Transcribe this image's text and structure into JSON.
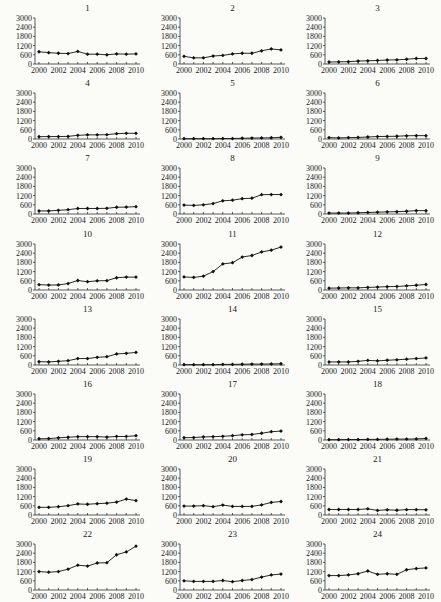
{
  "figure": {
    "layout": {
      "rows": 8,
      "cols": 3
    }
  },
  "chart_data": [
    {
      "type": "line",
      "title": "1",
      "x": [
        2000,
        2001,
        2002,
        2003,
        2004,
        2005,
        2006,
        2007,
        2008,
        2009,
        2010
      ],
      "values": [
        800,
        740,
        700,
        680,
        820,
        640,
        640,
        600,
        660,
        640,
        660
      ],
      "xlabel": "",
      "ylabel": "",
      "ylim": [
        0,
        3000
      ],
      "yticks": [
        0,
        600,
        1200,
        1800,
        2400,
        3000
      ],
      "xticks": [
        2000,
        2002,
        2004,
        2006,
        2008,
        2010
      ],
      "grid": false
    },
    {
      "type": "line",
      "title": "2",
      "x": [
        2000,
        2001,
        2002,
        2003,
        2004,
        2005,
        2006,
        2007,
        2008,
        2009,
        2010
      ],
      "values": [
        500,
        400,
        400,
        520,
        560,
        660,
        700,
        700,
        860,
        980,
        920
      ],
      "xlabel": "",
      "ylabel": "",
      "ylim": [
        0,
        3000
      ],
      "yticks": [
        0,
        600,
        1200,
        1800,
        2400,
        3000
      ],
      "xticks": [
        2000,
        2002,
        2004,
        2006,
        2008,
        2010
      ],
      "grid": false
    },
    {
      "type": "line",
      "title": "3",
      "x": [
        2000,
        2001,
        2002,
        2003,
        2004,
        2005,
        2006,
        2007,
        2008,
        2009,
        2010
      ],
      "values": [
        130,
        140,
        150,
        190,
        210,
        230,
        260,
        270,
        310,
        360,
        360
      ],
      "xlabel": "",
      "ylabel": "",
      "ylim": [
        0,
        3000
      ],
      "yticks": [
        0,
        600,
        1200,
        1800,
        2400,
        3000
      ],
      "xticks": [
        2000,
        2002,
        2004,
        2006,
        2008,
        2010
      ],
      "grid": false
    },
    {
      "type": "line",
      "title": "4",
      "x": [
        2000,
        2001,
        2002,
        2003,
        2004,
        2005,
        2006,
        2007,
        2008,
        2009,
        2010
      ],
      "values": [
        150,
        160,
        160,
        170,
        240,
        270,
        270,
        280,
        350,
        370,
        370
      ],
      "xlabel": "",
      "ylabel": "",
      "ylim": [
        0,
        3000
      ],
      "yticks": [
        0,
        600,
        1200,
        1800,
        2400,
        3000
      ],
      "xticks": [
        2000,
        2002,
        2004,
        2006,
        2008,
        2010
      ],
      "grid": false
    },
    {
      "type": "line",
      "title": "5",
      "x": [
        2000,
        2001,
        2002,
        2003,
        2004,
        2005,
        2006,
        2007,
        2008,
        2009,
        2010
      ],
      "values": [
        20,
        20,
        20,
        20,
        30,
        30,
        50,
        60,
        70,
        80,
        110
      ],
      "xlabel": "",
      "ylabel": "",
      "ylim": [
        0,
        3000
      ],
      "yticks": [
        0,
        600,
        1200,
        1800,
        2400,
        3000
      ],
      "xticks": [
        2000,
        2002,
        2004,
        2006,
        2008,
        2010
      ],
      "grid": false
    },
    {
      "type": "line",
      "title": "6",
      "x": [
        2000,
        2001,
        2002,
        2003,
        2004,
        2005,
        2006,
        2007,
        2008,
        2009,
        2010
      ],
      "values": [
        90,
        70,
        90,
        100,
        130,
        160,
        170,
        180,
        210,
        220,
        220
      ],
      "xlabel": "",
      "ylabel": "",
      "ylim": [
        0,
        3000
      ],
      "yticks": [
        0,
        600,
        1200,
        1800,
        2400,
        3000
      ],
      "xticks": [
        2000,
        2002,
        2004,
        2006,
        2008,
        2010
      ],
      "grid": false
    },
    {
      "type": "line",
      "title": "7",
      "x": [
        2000,
        2001,
        2002,
        2003,
        2004,
        2005,
        2006,
        2007,
        2008,
        2009,
        2010
      ],
      "values": [
        200,
        200,
        240,
        280,
        360,
        360,
        360,
        370,
        440,
        450,
        480
      ],
      "xlabel": "",
      "ylabel": "",
      "ylim": [
        0,
        3000
      ],
      "yticks": [
        0,
        600,
        1200,
        1800,
        2400,
        3000
      ],
      "xticks": [
        2000,
        2002,
        2004,
        2006,
        2008,
        2010
      ],
      "grid": false
    },
    {
      "type": "line",
      "title": "8",
      "x": [
        2000,
        2001,
        2002,
        2003,
        2004,
        2005,
        2006,
        2007,
        2008,
        2009,
        2010
      ],
      "values": [
        580,
        560,
        600,
        680,
        860,
        900,
        1000,
        1030,
        1260,
        1270,
        1270
      ],
      "xlabel": "",
      "ylabel": "",
      "ylim": [
        0,
        3000
      ],
      "yticks": [
        0,
        600,
        1200,
        1800,
        2400,
        3000
      ],
      "xticks": [
        2000,
        2002,
        2004,
        2006,
        2008,
        2010
      ],
      "grid": false
    },
    {
      "type": "line",
      "title": "9",
      "x": [
        2000,
        2001,
        2002,
        2003,
        2004,
        2005,
        2006,
        2007,
        2008,
        2009,
        2010
      ],
      "values": [
        60,
        60,
        60,
        80,
        100,
        120,
        140,
        150,
        180,
        220,
        220
      ],
      "xlabel": "",
      "ylabel": "",
      "ylim": [
        0,
        3000
      ],
      "yticks": [
        0,
        600,
        1200,
        1800,
        2400,
        3000
      ],
      "xticks": [
        2000,
        2002,
        2004,
        2006,
        2008,
        2010
      ],
      "grid": false
    },
    {
      "type": "line",
      "title": "10",
      "x": [
        2000,
        2001,
        2002,
        2003,
        2004,
        2005,
        2006,
        2007,
        2008,
        2009,
        2010
      ],
      "values": [
        350,
        320,
        330,
        420,
        620,
        540,
        600,
        610,
        800,
        840,
        840
      ],
      "xlabel": "",
      "ylabel": "",
      "ylim": [
        0,
        3000
      ],
      "yticks": [
        0,
        600,
        1200,
        1800,
        2400,
        3000
      ],
      "xticks": [
        2000,
        2002,
        2004,
        2006,
        2008,
        2010
      ],
      "grid": false
    },
    {
      "type": "line",
      "title": "11",
      "x": [
        2000,
        2001,
        2002,
        2003,
        2004,
        2005,
        2006,
        2007,
        2008,
        2009,
        2010
      ],
      "values": [
        850,
        820,
        900,
        1200,
        1700,
        1780,
        2150,
        2250,
        2480,
        2600,
        2800
      ],
      "xlabel": "",
      "ylabel": "",
      "ylim": [
        0,
        3000
      ],
      "yticks": [
        0,
        600,
        1200,
        1800,
        2400,
        3000
      ],
      "xticks": [
        2000,
        2002,
        2004,
        2006,
        2008,
        2010
      ],
      "grid": false
    },
    {
      "type": "line",
      "title": "12",
      "x": [
        2000,
        2001,
        2002,
        2003,
        2004,
        2005,
        2006,
        2007,
        2008,
        2009,
        2010
      ],
      "values": [
        120,
        130,
        140,
        140,
        170,
        190,
        220,
        230,
        270,
        310,
        360
      ],
      "xlabel": "",
      "ylabel": "",
      "ylim": [
        0,
        3000
      ],
      "yticks": [
        0,
        600,
        1200,
        1800,
        2400,
        3000
      ],
      "xticks": [
        2000,
        2002,
        2004,
        2006,
        2008,
        2010
      ],
      "grid": false
    },
    {
      "type": "line",
      "title": "13",
      "x": [
        2000,
        2001,
        2002,
        2003,
        2004,
        2005,
        2006,
        2007,
        2008,
        2009,
        2010
      ],
      "values": [
        220,
        200,
        240,
        280,
        420,
        420,
        500,
        540,
        720,
        760,
        820
      ],
      "xlabel": "",
      "ylabel": "",
      "ylim": [
        0,
        3000
      ],
      "yticks": [
        0,
        600,
        1200,
        1800,
        2400,
        3000
      ],
      "xticks": [
        2000,
        2002,
        2004,
        2006,
        2008,
        2010
      ],
      "grid": false
    },
    {
      "type": "line",
      "title": "14",
      "x": [
        2000,
        2001,
        2002,
        2003,
        2004,
        2005,
        2006,
        2007,
        2008,
        2009,
        2010
      ],
      "values": [
        20,
        20,
        20,
        20,
        40,
        40,
        50,
        60,
        60,
        70,
        80
      ],
      "xlabel": "",
      "ylabel": "",
      "ylim": [
        0,
        3000
      ],
      "yticks": [
        0,
        600,
        1200,
        1800,
        2400,
        3000
      ],
      "xticks": [
        2000,
        2002,
        2004,
        2006,
        2008,
        2010
      ],
      "grid": false
    },
    {
      "type": "line",
      "title": "15",
      "x": [
        2000,
        2001,
        2002,
        2003,
        2004,
        2005,
        2006,
        2007,
        2008,
        2009,
        2010
      ],
      "values": [
        200,
        200,
        200,
        240,
        300,
        270,
        310,
        340,
        380,
        420,
        460
      ],
      "xlabel": "",
      "ylabel": "",
      "ylim": [
        0,
        3000
      ],
      "yticks": [
        0,
        600,
        1200,
        1800,
        2400,
        3000
      ],
      "xticks": [
        2000,
        2002,
        2004,
        2006,
        2008,
        2010
      ],
      "grid": false
    },
    {
      "type": "line",
      "title": "16",
      "x": [
        2000,
        2001,
        2002,
        2003,
        2004,
        2005,
        2006,
        2007,
        2008,
        2009,
        2010
      ],
      "values": [
        80,
        90,
        140,
        180,
        220,
        220,
        220,
        190,
        230,
        230,
        280
      ],
      "xlabel": "",
      "ylabel": "",
      "ylim": [
        0,
        3000
      ],
      "yticks": [
        0,
        600,
        1200,
        1800,
        2400,
        3000
      ],
      "xticks": [
        2000,
        2002,
        2004,
        2006,
        2008,
        2010
      ],
      "grid": false
    },
    {
      "type": "line",
      "title": "17",
      "x": [
        2000,
        2001,
        2002,
        2003,
        2004,
        2005,
        2006,
        2007,
        2008,
        2009,
        2010
      ],
      "values": [
        150,
        160,
        200,
        220,
        240,
        280,
        340,
        360,
        440,
        540,
        580
      ],
      "xlabel": "",
      "ylabel": "",
      "ylim": [
        0,
        3000
      ],
      "yticks": [
        0,
        600,
        1200,
        1800,
        2400,
        3000
      ],
      "xticks": [
        2000,
        2002,
        2004,
        2006,
        2008,
        2010
      ],
      "grid": false
    },
    {
      "type": "line",
      "title": "18",
      "x": [
        2000,
        2001,
        2002,
        2003,
        2004,
        2005,
        2006,
        2007,
        2008,
        2009,
        2010
      ],
      "values": [
        20,
        20,
        30,
        30,
        40,
        40,
        50,
        60,
        60,
        70,
        100
      ],
      "xlabel": "",
      "ylabel": "",
      "ylim": [
        0,
        3000
      ],
      "yticks": [
        0,
        600,
        1200,
        1800,
        2400,
        3000
      ],
      "xticks": [
        2000,
        2002,
        2004,
        2006,
        2008,
        2010
      ],
      "grid": false
    },
    {
      "type": "line",
      "title": "19",
      "x": [
        2000,
        2001,
        2002,
        2003,
        2004,
        2005,
        2006,
        2007,
        2008,
        2009,
        2010
      ],
      "values": [
        500,
        500,
        540,
        610,
        720,
        700,
        740,
        770,
        840,
        1040,
        940
      ],
      "xlabel": "",
      "ylabel": "",
      "ylim": [
        0,
        3000
      ],
      "yticks": [
        0,
        600,
        1200,
        1800,
        2400,
        3000
      ],
      "xticks": [
        2000,
        2002,
        2004,
        2006,
        2008,
        2010
      ],
      "grid": false
    },
    {
      "type": "line",
      "title": "20",
      "x": [
        2000,
        2001,
        2002,
        2003,
        2004,
        2005,
        2006,
        2007,
        2008,
        2009,
        2010
      ],
      "values": [
        580,
        580,
        610,
        540,
        650,
        560,
        560,
        560,
        660,
        820,
        880
      ],
      "xlabel": "",
      "ylabel": "",
      "ylim": [
        0,
        3000
      ],
      "yticks": [
        0,
        600,
        1200,
        1800,
        2400,
        3000
      ],
      "xticks": [
        2000,
        2002,
        2004,
        2006,
        2008,
        2010
      ],
      "grid": false
    },
    {
      "type": "line",
      "title": "21",
      "x": [
        2000,
        2001,
        2002,
        2003,
        2004,
        2005,
        2006,
        2007,
        2008,
        2009,
        2010
      ],
      "values": [
        360,
        360,
        360,
        360,
        400,
        300,
        340,
        310,
        350,
        350,
        340
      ],
      "xlabel": "",
      "ylabel": "",
      "ylim": [
        0,
        3000
      ],
      "yticks": [
        0,
        600,
        1200,
        1800,
        2400,
        3000
      ],
      "xticks": [
        2000,
        2002,
        2004,
        2006,
        2008,
        2010
      ],
      "grid": false
    },
    {
      "type": "line",
      "title": "22",
      "x": [
        2000,
        2001,
        2002,
        2003,
        2004,
        2005,
        2006,
        2007,
        2008,
        2009,
        2010
      ],
      "values": [
        1200,
        1160,
        1200,
        1360,
        1620,
        1560,
        1760,
        1780,
        2300,
        2480,
        2860
      ],
      "xlabel": "",
      "ylabel": "",
      "ylim": [
        0,
        3000
      ],
      "yticks": [
        0,
        600,
        1200,
        1800,
        2400,
        3000
      ],
      "xticks": [
        2000,
        2002,
        2004,
        2006,
        2008,
        2010
      ],
      "grid": false
    },
    {
      "type": "line",
      "title": "23",
      "x": [
        2000,
        2001,
        2002,
        2003,
        2004,
        2005,
        2006,
        2007,
        2008,
        2009,
        2010
      ],
      "values": [
        600,
        560,
        560,
        560,
        620,
        540,
        620,
        680,
        840,
        980,
        1040
      ],
      "xlabel": "",
      "ylabel": "",
      "ylim": [
        0,
        3000
      ],
      "yticks": [
        0,
        600,
        1200,
        1800,
        2400,
        3000
      ],
      "xticks": [
        2000,
        2002,
        2004,
        2006,
        2008,
        2010
      ],
      "grid": false
    },
    {
      "type": "line",
      "title": "24",
      "x": [
        2000,
        2001,
        2002,
        2003,
        2004,
        2005,
        2006,
        2007,
        2008,
        2009,
        2010
      ],
      "values": [
        940,
        940,
        980,
        1060,
        1240,
        1020,
        1060,
        1020,
        1320,
        1400,
        1440
      ],
      "xlabel": "",
      "ylabel": "",
      "ylim": [
        0,
        3000
      ],
      "yticks": [
        0,
        600,
        1200,
        1800,
        2400,
        3000
      ],
      "xticks": [
        2000,
        2002,
        2004,
        2006,
        2008,
        2010
      ],
      "grid": false
    }
  ]
}
